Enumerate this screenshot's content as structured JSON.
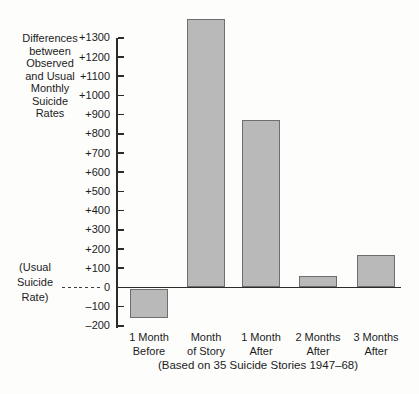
{
  "chart_data": {
    "type": "bar",
    "title": "",
    "xlabel": "",
    "ylabel": "Differences between Observed and Usual Monthly Suicide Rates",
    "ylabel_lines": "Differences\nbetween\nObserved\nand Usual\nMonthly\nSuicide\nRates",
    "categories": [
      "1 Month Before",
      "Month of Story",
      "1 Month After",
      "2 Months After",
      "3 Months After"
    ],
    "category_lines": [
      "1 Month\nBefore",
      "Month\nof Story",
      "1 Month\nAfter",
      "2 Months\nAfter",
      "3 Months\nAfter"
    ],
    "values": [
      -150,
      1400,
      870,
      60,
      170
    ],
    "ylim": [
      -200,
      1300
    ],
    "yticks": [
      1300,
      1200,
      1100,
      1000,
      900,
      800,
      700,
      600,
      500,
      400,
      300,
      200,
      100,
      0,
      -100,
      -200
    ],
    "ytick_labels": [
      "+1300",
      "+1200",
      "+1100",
      "+1000",
      "+900",
      "+800",
      "+700",
      "+600",
      "+500",
      "+400",
      "+300",
      "+200",
      "+100",
      "0",
      "–100",
      "–200"
    ],
    "zero_annotation": "(Usual Suicide Rate)",
    "zero_annotation_lines": "(Usual\nSuicide\nRate)",
    "caption": "(Based on 35 Suicide Stories 1947–68)",
    "grid": false,
    "legend": null,
    "bar_fill": "#b9b9b9",
    "bar_border": "#6e6e6e"
  }
}
